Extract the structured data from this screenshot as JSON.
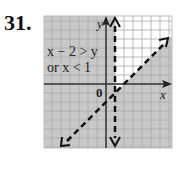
{
  "problem": {
    "number": "31."
  },
  "chart_data": {
    "type": "inequality-graph",
    "title": "",
    "inequality_lines": [
      "x − 2 > y",
      "or  x < 1"
    ],
    "xlabel": "x",
    "ylabel": "y",
    "origin_label": "0",
    "grid": true,
    "xlim": [
      -7,
      7
    ],
    "ylim": [
      -7,
      7.5
    ],
    "boundaries": [
      {
        "name": "y = x - 2",
        "style": "dashed",
        "slope": 1,
        "intercept": -2,
        "arrows": "both"
      },
      {
        "name": "x = 1",
        "style": "dashed",
        "vertical": true,
        "x": 1,
        "arrows": "both"
      }
    ],
    "shaded_region": "union of y < x - 2 and x < 1 (everything except x ≥ 1 and y ≥ x - 2)",
    "unshaded_region": "x > 1 and y > x - 2",
    "colors": {
      "shade": "#c8c8c8",
      "grid_on_shade": "#a0a0a0",
      "grid_on_white": "#c4c4c4",
      "axis": "#333333",
      "boundary": "#111111",
      "background": "#ffffff"
    }
  }
}
